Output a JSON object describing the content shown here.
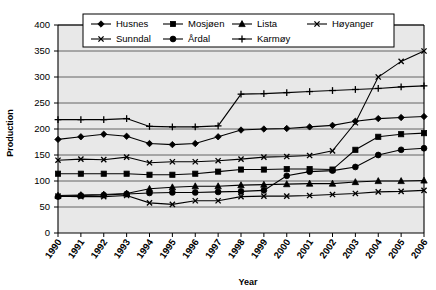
{
  "chart_data": {
    "type": "line",
    "title": "",
    "xlabel": "Year",
    "ylabel": "Production",
    "categories": [
      "1990",
      "1991",
      "1992",
      "1993",
      "1994",
      "1995",
      "1996",
      "1997",
      "1998",
      "1999",
      "2000",
      "2001",
      "2002",
      "2003",
      "2004",
      "2005",
      "2006"
    ],
    "x": [
      1990,
      1991,
      1992,
      1993,
      1994,
      1995,
      1996,
      1997,
      1998,
      1999,
      2000,
      2001,
      2002,
      2003,
      2004,
      2005,
      2006
    ],
    "ylim": [
      0,
      400
    ],
    "yticks": [
      0,
      50,
      100,
      150,
      200,
      250,
      300,
      350,
      400
    ],
    "xlim": [
      1990,
      2006
    ],
    "grid": true,
    "legend_position": "top-inside",
    "series": [
      {
        "name": "Husnes",
        "marker": "diamond",
        "values": [
          180,
          185,
          190,
          186,
          172,
          170,
          172,
          185,
          198,
          200,
          201,
          204,
          207,
          215,
          220,
          222,
          224
        ]
      },
      {
        "name": "Mosjøen",
        "marker": "square",
        "values": [
          114,
          114,
          114,
          114,
          112,
          112,
          114,
          118,
          122,
          122,
          123,
          123,
          122,
          160,
          185,
          190,
          192
        ]
      },
      {
        "name": "Lista",
        "marker": "triangle",
        "values": [
          72,
          73,
          74,
          76,
          85,
          88,
          90,
          90,
          92,
          93,
          94,
          95,
          95,
          98,
          100,
          100,
          101
        ]
      },
      {
        "name": "Høyanger",
        "marker": "x-thin",
        "values": [
          71,
          70,
          70,
          72,
          58,
          55,
          62,
          62,
          70,
          71,
          71,
          72,
          74,
          76,
          79,
          80,
          82
        ]
      },
      {
        "name": "Sunndal",
        "marker": "x-bold",
        "values": [
          140,
          142,
          141,
          146,
          135,
          137,
          137,
          139,
          142,
          146,
          147,
          149,
          158,
          212,
          300,
          330,
          350
        ]
      },
      {
        "name": "Årdal",
        "marker": "circle",
        "values": [
          70,
          72,
          73,
          75,
          77,
          78,
          78,
          79,
          80,
          82,
          110,
          118,
          120,
          127,
          150,
          160,
          163
        ]
      },
      {
        "name": "Karmøy",
        "marker": "plus",
        "values": [
          218,
          218,
          218,
          220,
          205,
          204,
          204,
          206,
          267,
          268,
          270,
          272,
          274,
          276,
          278,
          281,
          283
        ]
      }
    ]
  },
  "legend": {
    "entries": [
      {
        "label": "Husnes",
        "marker": "diamond"
      },
      {
        "label": "Mosjøen",
        "marker": "square"
      },
      {
        "label": "Lista",
        "marker": "triangle"
      },
      {
        "label": "Høyanger",
        "marker": "x-thin"
      },
      {
        "label": "Sunndal",
        "marker": "x-bold"
      },
      {
        "label": "Årdal",
        "marker": "circle"
      },
      {
        "label": "Karmøy",
        "marker": "plus"
      }
    ]
  },
  "colors": {
    "plot_background": "#e8e8e8",
    "grid": "#555555",
    "axis": "#000000",
    "series": "#000000",
    "page_background": "#ffffff"
  }
}
